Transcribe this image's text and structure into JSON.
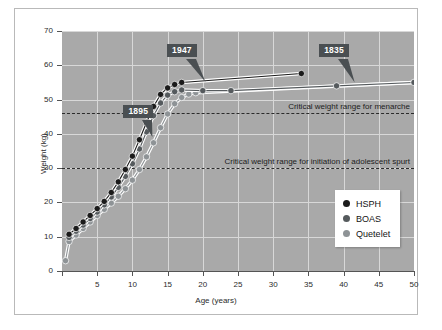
{
  "figure": {
    "background_color": "#ffffff",
    "plot_background_color": "#a9a9a9",
    "grid_color": "#d8d8d8"
  },
  "chart_data": {
    "type": "line",
    "title": "",
    "xlabel": "Age (years)",
    "ylabel": "Weight (kg)",
    "xlim": [
      0,
      50
    ],
    "ylim": [
      0,
      70
    ],
    "xticks": [
      0,
      5,
      10,
      15,
      20,
      25,
      30,
      35,
      40,
      45,
      50
    ],
    "xtick_labels": [
      "",
      "5",
      "10",
      "15",
      "20",
      "25",
      "30",
      "35",
      "40",
      "45",
      "50"
    ],
    "yticks": [
      0,
      10,
      20,
      30,
      40,
      50,
      60,
      70
    ],
    "ytick_labels": [
      "0",
      "10",
      "20",
      "30",
      "40",
      "50",
      "60",
      "70"
    ],
    "grid": true,
    "legend_position": "center-right",
    "series": [
      {
        "name": "HSPH",
        "color": "#1b1b1b",
        "marker": "circle",
        "points": [
          {
            "x": 1.0,
            "y": 10.7
          },
          {
            "x": 2.0,
            "y": 12.4
          },
          {
            "x": 3.0,
            "y": 14.3
          },
          {
            "x": 4.0,
            "y": 16.2
          },
          {
            "x": 5.0,
            "y": 18.2
          },
          {
            "x": 6.0,
            "y": 20.3
          },
          {
            "x": 7.0,
            "y": 22.9
          },
          {
            "x": 8.0,
            "y": 26.0
          },
          {
            "x": 9.0,
            "y": 29.6
          },
          {
            "x": 10.0,
            "y": 33.5
          },
          {
            "x": 11.0,
            "y": 38.3
          },
          {
            "x": 12.0,
            "y": 43.3
          },
          {
            "x": 13.0,
            "y": 48.0
          },
          {
            "x": 14.0,
            "y": 51.5
          },
          {
            "x": 15.0,
            "y": 53.4
          },
          {
            "x": 16.0,
            "y": 54.4
          },
          {
            "x": 17.0,
            "y": 55.0
          },
          {
            "x": 34.0,
            "y": 57.6
          }
        ]
      },
      {
        "name": "BOAS",
        "color": "#555a5d",
        "marker": "circle",
        "points": [
          {
            "x": 1.0,
            "y": 9.8
          },
          {
            "x": 2.0,
            "y": 11.6
          },
          {
            "x": 3.0,
            "y": 13.4
          },
          {
            "x": 4.0,
            "y": 15.3
          },
          {
            "x": 5.0,
            "y": 17.2
          },
          {
            "x": 6.0,
            "y": 19.3
          },
          {
            "x": 7.0,
            "y": 21.6
          },
          {
            "x": 8.0,
            "y": 24.4
          },
          {
            "x": 9.0,
            "y": 27.6
          },
          {
            "x": 10.0,
            "y": 31.3
          },
          {
            "x": 11.0,
            "y": 35.6
          },
          {
            "x": 12.0,
            "y": 40.6
          },
          {
            "x": 13.0,
            "y": 45.3
          },
          {
            "x": 14.0,
            "y": 49.0
          },
          {
            "x": 15.0,
            "y": 51.3
          },
          {
            "x": 16.0,
            "y": 52.3
          },
          {
            "x": 17.0,
            "y": 52.8
          },
          {
            "x": 20.0,
            "y": 52.6
          },
          {
            "x": 24.0,
            "y": 52.6
          },
          {
            "x": 39.0,
            "y": 54.0
          },
          {
            "x": 50.0,
            "y": 55.0
          }
        ]
      },
      {
        "name": "Quetelet",
        "color": "#8e9396",
        "marker": "circle",
        "points": [
          {
            "x": 0.5,
            "y": 3.0
          },
          {
            "x": 1.0,
            "y": 8.6
          },
          {
            "x": 2.0,
            "y": 10.5
          },
          {
            "x": 3.0,
            "y": 12.4
          },
          {
            "x": 4.0,
            "y": 14.3
          },
          {
            "x": 5.0,
            "y": 16.2
          },
          {
            "x": 6.0,
            "y": 18.0
          },
          {
            "x": 7.0,
            "y": 19.8
          },
          {
            "x": 8.0,
            "y": 21.8
          },
          {
            "x": 9.0,
            "y": 24.0
          },
          {
            "x": 10.0,
            "y": 26.5
          },
          {
            "x": 11.0,
            "y": 29.6
          },
          {
            "x": 12.0,
            "y": 33.3
          },
          {
            "x": 13.0,
            "y": 37.4
          },
          {
            "x": 14.0,
            "y": 41.8
          },
          {
            "x": 15.0,
            "y": 45.8
          },
          {
            "x": 16.0,
            "y": 48.8
          },
          {
            "x": 17.0,
            "y": 50.6
          },
          {
            "x": 18.0,
            "y": 51.6
          },
          {
            "x": 19.0,
            "y": 52.0
          },
          {
            "x": 50.0,
            "y": 55.0
          }
        ]
      }
    ],
    "threshold_lines": [
      {
        "name": "menarche",
        "y": 46,
        "label": "Critical weight range for menarche",
        "style": "dashed"
      },
      {
        "name": "adolescent-spurt",
        "y": 30,
        "label": "Critical weight range for initiation of adolescent spurt",
        "style": "dashed"
      }
    ],
    "annotations": [
      {
        "label": "1947",
        "box_x": 17.2,
        "box_y": 64.5,
        "point_x": 20.4,
        "point_y": 55.2
      },
      {
        "label": "1895",
        "box_x": 11.0,
        "box_y": 46.8,
        "point_x": 12.9,
        "point_y": 39.2
      },
      {
        "label": "1835",
        "box_x": 38.8,
        "box_y": 64.5,
        "point_x": 41.6,
        "point_y": 55.0
      }
    ],
    "legend": [
      {
        "label": "HSPH",
        "color": "#1b1b1b"
      },
      {
        "label": "BOAS",
        "color": "#555a5d"
      },
      {
        "label": "Quetelet",
        "color": "#8e9396"
      }
    ]
  }
}
